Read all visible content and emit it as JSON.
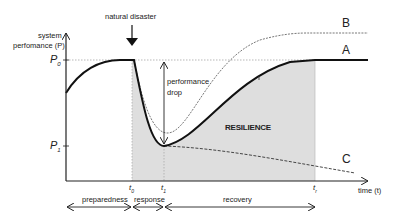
{
  "diagram": {
    "title": "",
    "event_label": "natural disaster",
    "y_axis_label_line1": "system",
    "y_axis_label_line2": "perfomance (P)",
    "x_axis_label": "time (t)",
    "y_ticks": [
      {
        "label": "P",
        "sub": "0"
      },
      {
        "label": "P",
        "sub": "1"
      }
    ],
    "x_ticks": [
      {
        "label": "t",
        "sub": "0"
      },
      {
        "label": "t",
        "sub": "1"
      },
      {
        "label": "t",
        "sub": "r"
      }
    ],
    "drop_label_line1": "performance",
    "drop_label_line2": "drop",
    "area_label": "RESILIENCE",
    "curves": [
      {
        "name": "A",
        "style": "solid-thick",
        "description": "recovery to original performance"
      },
      {
        "name": "B",
        "style": "dashed-thin",
        "description": "recovery to improved performance"
      },
      {
        "name": "C",
        "style": "dashed",
        "description": "continued decline"
      }
    ],
    "phases": [
      {
        "label": "preparedness"
      },
      {
        "label": "response"
      },
      {
        "label": "recovery"
      }
    ],
    "annotation_marker": "i",
    "colors": {
      "line": "#111111",
      "shading": "#dedede",
      "guide": "#999999"
    }
  }
}
